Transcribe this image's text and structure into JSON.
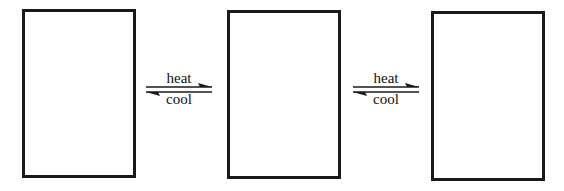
{
  "diagram": {
    "boxes": [
      {
        "id": "state-1"
      },
      {
        "id": "state-2"
      },
      {
        "id": "state-3"
      }
    ],
    "equilibria": [
      {
        "forward_label": "heat",
        "reverse_label": "cool"
      },
      {
        "forward_label": "heat",
        "reverse_label": "cool"
      }
    ],
    "colors": {
      "stroke": "#1a1a1a",
      "background": "#ffffff"
    }
  }
}
